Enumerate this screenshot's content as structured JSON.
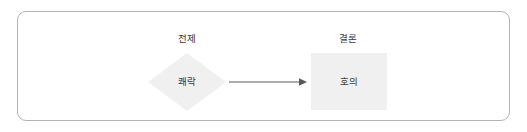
{
  "diagram": {
    "type": "flow",
    "frame": {
      "border_color": "#b3b3b3",
      "background": "#ffffff"
    },
    "columns": [
      {
        "id": "premise",
        "label": "전제"
      },
      {
        "id": "conclusion",
        "label": "결론"
      }
    ],
    "nodes": [
      {
        "id": "premise-node",
        "shape": "diamond",
        "text": "쾌락",
        "fill": "#f0f0f0",
        "text_color": "#3a3a3a"
      },
      {
        "id": "conclusion-node",
        "shape": "rectangle",
        "text": "호의",
        "fill": "#f0f0f0",
        "text_color": "#3a3a3a"
      }
    ],
    "edges": [
      {
        "id": "premise-to-conclusion",
        "from": "premise-node",
        "to": "conclusion-node",
        "style": "solid",
        "arrowhead": "filled-triangle",
        "color": "#5a5a5a",
        "label": ""
      }
    ]
  }
}
